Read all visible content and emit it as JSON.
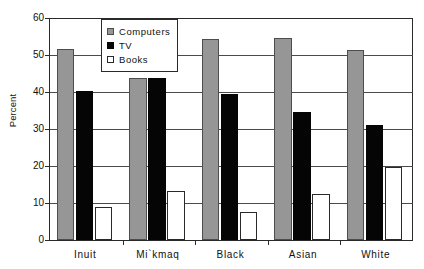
{
  "chart_data": {
    "type": "bar",
    "title": "",
    "xlabel": "",
    "ylabel": "Percent",
    "ylim": [
      0,
      60
    ],
    "ytick_step": 10,
    "yticks": [
      0,
      10,
      20,
      30,
      40,
      50,
      60
    ],
    "grid": true,
    "legend_position": "top-left-inside",
    "categories": [
      "Inuit",
      "Mi`kmaq",
      "Black",
      "Asian",
      "White"
    ],
    "series": [
      {
        "name": "Computers",
        "color": "#969696",
        "values": [
          51.5,
          43.9,
          54.3,
          54.5,
          51.4
        ]
      },
      {
        "name": "TV",
        "color": "#050505",
        "values": [
          40.3,
          43.9,
          39.5,
          34.6,
          31.0
        ]
      },
      {
        "name": "Books",
        "color": "#ffffff",
        "values": [
          8.8,
          13.2,
          7.7,
          12.4,
          19.8
        ]
      }
    ]
  },
  "legend": {
    "entries": [
      {
        "label": "Computers",
        "swatch": "computers-swatch"
      },
      {
        "label": "TV",
        "swatch": "tv-swatch"
      },
      {
        "label": "Books",
        "swatch": "books-swatch"
      }
    ]
  },
  "axes": {
    "y_title": "Percent",
    "y_tick_labels": [
      "60",
      "50",
      "40",
      "30",
      "20",
      "10",
      "0"
    ],
    "x_tick_labels": [
      "Inuit",
      "Mi`kmaq",
      "Black",
      "Asian",
      "White"
    ]
  }
}
